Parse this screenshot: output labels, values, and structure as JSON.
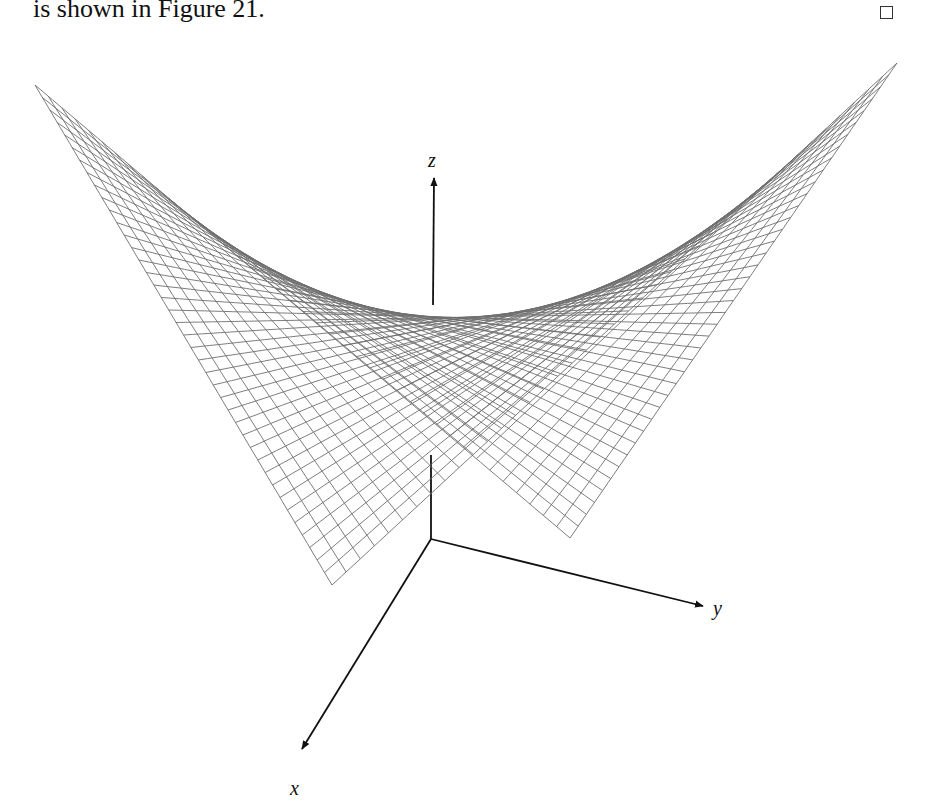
{
  "text": {
    "sentence_end": "is shown in Figure 21.",
    "end_of_proof_symbol": "□"
  },
  "figure": {
    "number": 21,
    "surface": "saddle (hyperbolic paraboloid)",
    "mesh_lines": 40,
    "mesh_color": "#6e6e6e",
    "axes": {
      "z": {
        "label": "z"
      },
      "y": {
        "label": "y"
      },
      "x": {
        "label": "x"
      }
    }
  }
}
